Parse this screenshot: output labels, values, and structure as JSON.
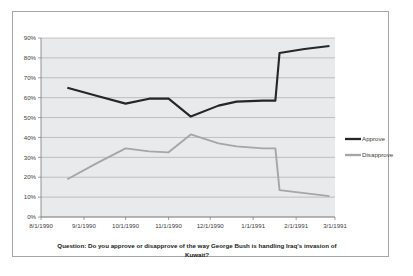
{
  "chart_data": {
    "type": "line",
    "title": "",
    "caption": "Question: Do you approve or disapprove of the way George Bush is handling Iraq's invasion of Kuwait?",
    "caption_line1": "Question: Do you approve or disapprove of the way George Bush is handling Iraq's invasion of",
    "caption_line2": "Kuwait?",
    "xlabel": "",
    "ylabel": "",
    "ylim": [
      0,
      90
    ],
    "ytick_labels": [
      "0%",
      "10%",
      "20%",
      "30%",
      "40%",
      "50%",
      "60%",
      "70%",
      "80%",
      "90%"
    ],
    "ytick_values": [
      0,
      10,
      20,
      30,
      40,
      50,
      60,
      70,
      80,
      90
    ],
    "xtick_labels": [
      "8/1/1990",
      "9/1/1990",
      "10/1/1990",
      "11/1/1990",
      "12/1/1990",
      "1/1/1991",
      "2/1/1991",
      "3/1/1991"
    ],
    "grid": true,
    "legend_position": "right",
    "legend": [
      "Approve",
      "Disapprove"
    ],
    "colors": {
      "approve": "#262626",
      "disapprove": "#a6a6a6",
      "plot_background": "#e8eaec",
      "gridline": "#9a9a9a",
      "frame_border": "#a6a6a6",
      "page_background": "#ffffff"
    },
    "x": [
      "8/20/1990",
      "9/10/1990",
      "10/1/1990",
      "10/18/1990",
      "11/1/1990",
      "11/17/1990",
      "12/7/1990",
      "12/20/1990",
      "1/8/1991",
      "1/17/1991",
      "1/20/1991",
      "2/7/1991",
      "2/25/1991"
    ],
    "series": [
      {
        "name": "Approve",
        "values": [
          65,
          61,
          57,
          59.5,
          59.5,
          50.5,
          56,
          58,
          58.5,
          58.5,
          82.5,
          84.5,
          86
        ]
      },
      {
        "name": "Disapprove",
        "values": [
          19,
          27,
          34.5,
          33,
          32.5,
          41.5,
          37,
          35.5,
          34.5,
          34.5,
          13.5,
          12,
          10.5
        ]
      }
    ]
  }
}
